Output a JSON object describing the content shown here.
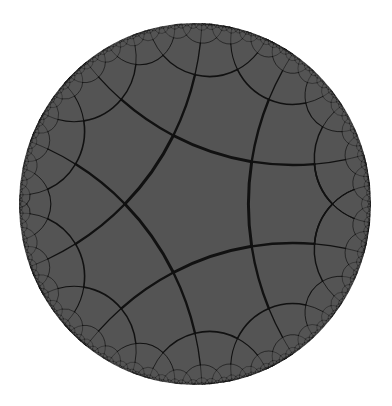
{
  "diagram": {
    "type": "hyperbolic-tiling",
    "model": "poincare-disk",
    "schlafli": {
      "p": 5,
      "q": 4
    },
    "disk": {
      "cx": 195,
      "cy": 204,
      "rx": 176,
      "ry": 181
    },
    "central_polygon": {
      "sides": 5,
      "first_vertex_angle_deg": 180,
      "vertex_pixels": [
        [
          125,
          205
        ],
        [
          174,
          135
        ],
        [
          252,
          162
        ],
        [
          253,
          247
        ],
        [
          174,
          274
        ]
      ]
    },
    "colors": {
      "background": "#ffffff",
      "disk_fill": "#545454",
      "edge_stroke": "#111111"
    },
    "edge_width_center": 3.0,
    "max_depth": 6
  }
}
